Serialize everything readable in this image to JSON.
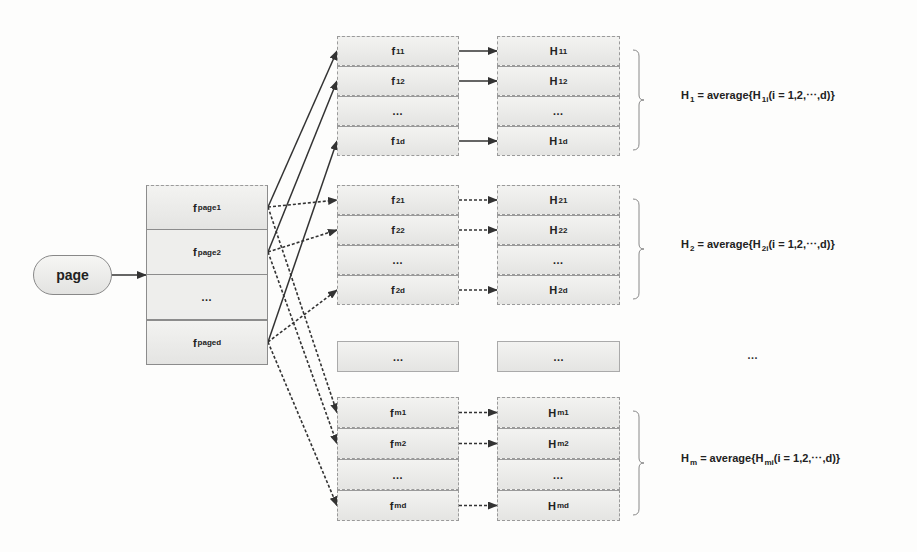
{
  "start_node": {
    "label": "page"
  },
  "page_features": [
    {
      "base": "f",
      "sub": "page1"
    },
    {
      "base": "f",
      "sub": "page2"
    },
    {
      "base": "…",
      "sub": ""
    },
    {
      "base": "f",
      "sub": "paged"
    }
  ],
  "groups": [
    {
      "f_cells": [
        {
          "base": "f",
          "sub": "11"
        },
        {
          "base": "f",
          "sub": "12"
        },
        {
          "base": "…",
          "sub": ""
        },
        {
          "base": "f",
          "sub": "1d"
        }
      ],
      "h_cells": [
        {
          "base": "H",
          "sub": "11"
        },
        {
          "base": "H",
          "sub": "12"
        },
        {
          "base": "…",
          "sub": ""
        },
        {
          "base": "H",
          "sub": "1d"
        }
      ],
      "formula": {
        "lhs": "H",
        "lhs_sub": "1",
        "eq": " = average{",
        "inner": "H",
        "inner_sub": "1i",
        "tail": "(i = 1,2,⋯,d)}"
      },
      "link_style": "solid"
    },
    {
      "f_cells": [
        {
          "base": "f",
          "sub": "21"
        },
        {
          "base": "f",
          "sub": "22"
        },
        {
          "base": "…",
          "sub": ""
        },
        {
          "base": "f",
          "sub": "2d"
        }
      ],
      "h_cells": [
        {
          "base": "H",
          "sub": "21"
        },
        {
          "base": "H",
          "sub": "22"
        },
        {
          "base": "…",
          "sub": ""
        },
        {
          "base": "H",
          "sub": "2d"
        }
      ],
      "formula": {
        "lhs": "H",
        "lhs_sub": "2",
        "eq": " = average{",
        "inner": "H",
        "inner_sub": "2i",
        "tail": "(i = 1,2,⋯,d)}"
      },
      "link_style": "dashed"
    },
    {
      "f_cells": [
        {
          "base": "f",
          "sub": "m1"
        },
        {
          "base": "f",
          "sub": "m2"
        },
        {
          "base": "…",
          "sub": ""
        },
        {
          "base": "f",
          "sub": "md"
        }
      ],
      "h_cells": [
        {
          "base": "H",
          "sub": "m1"
        },
        {
          "base": "H",
          "sub": "m2"
        },
        {
          "base": "…",
          "sub": ""
        },
        {
          "base": "H",
          "sub": "md"
        }
      ],
      "formula": {
        "lhs": "H",
        "lhs_sub": "m",
        "eq": " = average{",
        "inner": "H",
        "inner_sub": "mi",
        "tail": "(i = 1,2,⋯,d)}"
      },
      "link_style": "dashed"
    }
  ],
  "ellipsis_row": {
    "f_label": "…",
    "h_label": "…",
    "formula_label": "…"
  }
}
